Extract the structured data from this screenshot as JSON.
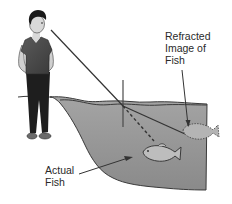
{
  "diagram": {
    "labels": {
      "refracted_image": "Refracted\nImage of\nFish",
      "actual_fish": "Actual\nFish"
    },
    "elements": [
      "observer",
      "line-of-sight",
      "normal-line",
      "water-surface",
      "dashed-true-ray",
      "actual-fish",
      "refracted-image-fish"
    ],
    "colors": {
      "water": "#9a9a9a",
      "water_dark": "#7d7d7d",
      "outline": "#3a3a3a",
      "shirt": "#4a4a4a",
      "pants": "#1e1e1e",
      "skin": "#d8d8d8",
      "hair": "#1a1a1a",
      "text": "#2a2a2a",
      "background": "#ffffff"
    }
  }
}
